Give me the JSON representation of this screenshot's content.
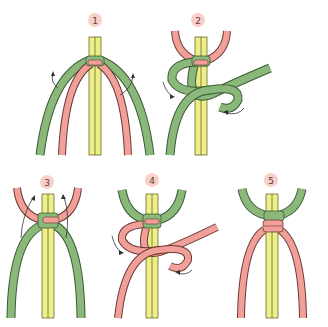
{
  "colors": {
    "green": "#8ab87a",
    "green_stroke": "#3c5a34",
    "pink": "#f0a098",
    "pink_stroke": "#6a3a34",
    "yellow": "#eeee88",
    "yellow_stroke": "#6a6a30",
    "badge": "#f8d0c8",
    "arrow": "#333333"
  },
  "steps": [
    {
      "number": "1",
      "description": "Green outer cords and pink inner cords around yellow core; green cords lift outward"
    },
    {
      "number": "2",
      "description": "Left green cord loops over core, right green cord passes under and through loop"
    },
    {
      "number": "3",
      "description": "First half knot tightened; pink cords lift outward"
    },
    {
      "number": "4",
      "description": "Pink cord loops over core, other pink cord passes through loop"
    },
    {
      "number": "5",
      "description": "Completed square knot with pink cords hanging down"
    }
  ]
}
